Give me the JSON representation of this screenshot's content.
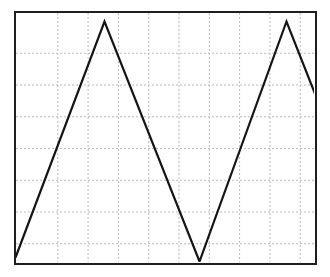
{
  "figure": {
    "name": "oscilloscope-waveform",
    "background_color": "#ffffff",
    "border_color": "#1a1a1a",
    "border_width_px": 2.5,
    "plot_left_px": 14,
    "plot_top_px": 11,
    "plot_width_px": 303,
    "plot_height_px": 254
  },
  "chart_data": {
    "type": "line",
    "title": "",
    "subtitle": "",
    "xlabel": "",
    "ylabel": "",
    "legend": [],
    "legend_position": "none",
    "annotations": [],
    "grid": {
      "visible": true,
      "style": "dashed",
      "color": "#b9b9b9",
      "dash_pattern": [
        2,
        2
      ],
      "line_width": 1,
      "x_divisions": 10,
      "y_divisions": 8,
      "x_gridlines_px": [
        44.3,
        74.6,
        104.9,
        135.2,
        165.5,
        195.8,
        226.1,
        256.4,
        286.7
      ],
      "y_gridlines_px": [
        42.75,
        74.5,
        106.25,
        138.0,
        169.75,
        201.5,
        233.25
      ]
    },
    "axes": {
      "xlim": [
        0,
        10
      ],
      "ylim": [
        0,
        8
      ],
      "x_tick_labels": [],
      "y_tick_labels": [],
      "ticks_visible": false
    },
    "series": [
      {
        "name": "triangle-wave",
        "color": "#111111",
        "line_width": 2.2,
        "marker": "none",
        "x": [
          0.07,
          3.0,
          6.14,
          9.0,
          10.0
        ],
        "y": [
          0.26,
          7.66,
          0.13,
          7.66,
          5.33
        ],
        "points_px": [
          [
            16,
            258
          ],
          [
            105,
            22
          ],
          [
            200,
            262
          ],
          [
            287,
            22
          ],
          [
            317,
            98
          ]
        ],
        "description": "asymmetric triangle wave, two full peaks, rising edges steeper than falling edges"
      }
    ]
  }
}
